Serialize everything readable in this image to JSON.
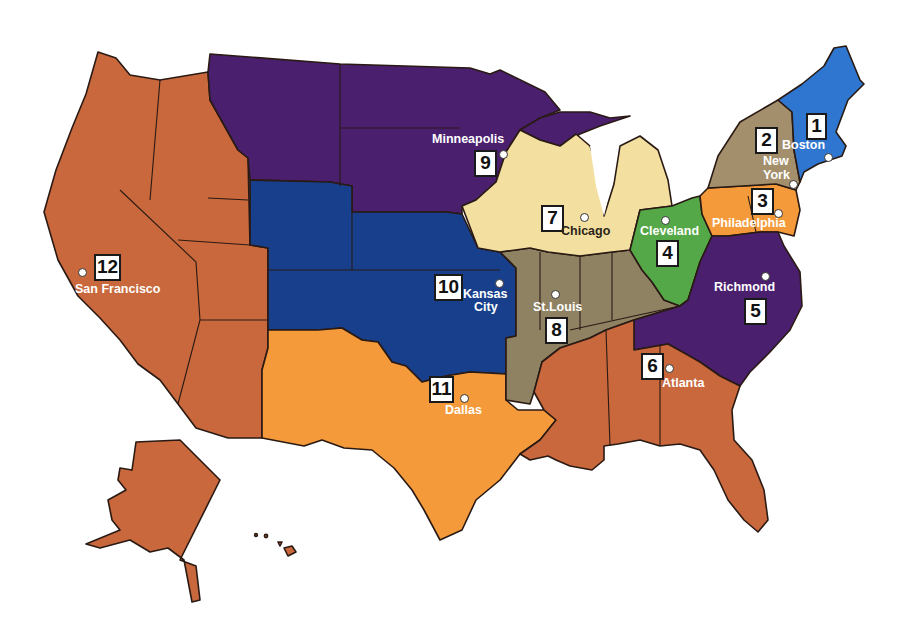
{
  "colors": {
    "d1": "#2e76cf",
    "d2": "#a48f6d",
    "d3": "#f49a3a",
    "d4": "#55a847",
    "d5": "#4a1f6e",
    "d6": "#c8683c",
    "d7": "#f3e0a0",
    "d8": "#8f8262",
    "d9": "#4a1f6e",
    "d10": "#173f8c",
    "d11": "#f49a3a",
    "d12": "#c8683c"
  },
  "districts": [
    {
      "number": "1",
      "city": "Boston"
    },
    {
      "number": "2",
      "city": "New York"
    },
    {
      "number": "3",
      "city": "Philadelphia"
    },
    {
      "number": "4",
      "city": "Cleveland"
    },
    {
      "number": "5",
      "city": "Richmond"
    },
    {
      "number": "6",
      "city": "Atlanta"
    },
    {
      "number": "7",
      "city": "Chicago"
    },
    {
      "number": "8",
      "city": "St.Louis"
    },
    {
      "number": "9",
      "city": "Minneapolis"
    },
    {
      "number": "10",
      "city": "Kansas City"
    },
    {
      "number": "11",
      "city": "Dallas"
    },
    {
      "number": "12",
      "city": "San Francisco"
    }
  ],
  "labels": {
    "new_york_line1": "New",
    "new_york_line2": "York",
    "kansas_city_line1": "Kansas",
    "kansas_city_line2": "City"
  }
}
